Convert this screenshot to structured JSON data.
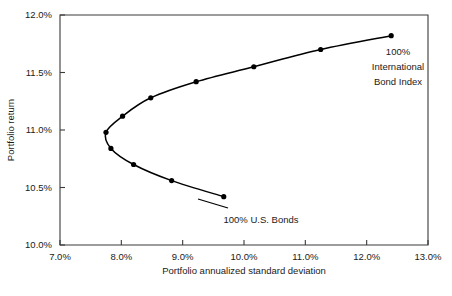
{
  "chart_data": {
    "type": "line",
    "title": "",
    "subtitle": "",
    "xlabel": "Portfolio annualized standard deviation",
    "ylabel": "Portfolio return",
    "xlim": [
      7.0,
      13.0
    ],
    "ylim": [
      10.0,
      12.0
    ],
    "xticks": [
      7.0,
      8.0,
      9.0,
      10.0,
      11.0,
      12.0,
      13.0
    ],
    "yticks": [
      10.0,
      10.5,
      11.0,
      11.5,
      12.0
    ],
    "xtick_labels": [
      "7.0%",
      "8.0%",
      "9.0%",
      "10.0%",
      "11.0%",
      "12.0%",
      "13.0%"
    ],
    "ytick_labels": [
      "10.0%",
      "10.5%",
      "11.0%",
      "11.5%",
      "12.0%"
    ],
    "grid": false,
    "legend": "none",
    "units": "percent",
    "series": [
      {
        "name": "Efficient frontier",
        "x": [
          9.67,
          8.82,
          8.2,
          7.83,
          7.75,
          8.02,
          8.48,
          9.22,
          10.16,
          11.25,
          12.4
        ],
        "y": [
          10.42,
          10.56,
          10.7,
          10.84,
          10.98,
          11.12,
          11.28,
          11.42,
          11.55,
          11.7,
          11.82
        ],
        "points": [
          {
            "x": 9.67,
            "y": 10.42,
            "label": "100% U.S. Bonds"
          },
          {
            "x": 8.82,
            "y": 10.56,
            "label": ""
          },
          {
            "x": 8.2,
            "y": 10.7,
            "label": ""
          },
          {
            "x": 7.83,
            "y": 10.84,
            "label": ""
          },
          {
            "x": 7.75,
            "y": 10.98,
            "label": ""
          },
          {
            "x": 8.02,
            "y": 11.12,
            "label": ""
          },
          {
            "x": 8.48,
            "y": 11.28,
            "label": ""
          },
          {
            "x": 9.22,
            "y": 11.42,
            "label": ""
          },
          {
            "x": 10.16,
            "y": 11.55,
            "label": ""
          },
          {
            "x": 11.25,
            "y": 11.7,
            "label": ""
          },
          {
            "x": 12.4,
            "y": 11.82,
            "label": "100% International Bond Index"
          }
        ]
      }
    ],
    "annotations": [
      {
        "name": "intl-bond-index-label",
        "lines": [
          "100%",
          "International",
          "Bond Index"
        ],
        "anchor_x": 12.4,
        "anchor_y": 11.82
      },
      {
        "name": "us-bonds-label",
        "lines": [
          "100% U.S. Bonds"
        ],
        "anchor_x": 9.67,
        "anchor_y": 10.42
      }
    ],
    "colors": {
      "line": "#000000",
      "marker": "#000000",
      "axis": "#3a3a3a",
      "text": "#1a1a1a",
      "background": "#ffffff"
    }
  }
}
